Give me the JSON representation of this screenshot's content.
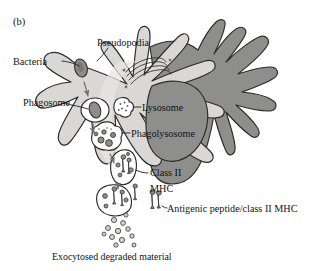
{
  "figure": {
    "panel_letter": "(b)",
    "caption_note": "",
    "domain_subject": "macrophage phagocytosis and class II MHC antigen presentation"
  },
  "labels": {
    "pseudopodia": "Pseudopodia",
    "bacteria": "Bacteria",
    "phagosome": "Phagosome",
    "lysosome": "Lysosome",
    "phagolysosome": "Phagolysosome",
    "class_ii": "Class II",
    "mhc": "MHC",
    "antigenic_peptide": "Antigenic peptide/class II MHC",
    "exocytosed": "Exocytosed degraded material"
  },
  "colors": {
    "cytoplasm": "#d9d8d4",
    "cytoplasm_light": "#e4e3df",
    "nucleus": "#8e8e8c",
    "cell_back": "#8e8e8c",
    "outline": "#2b2b2b",
    "bacteria_fill": "#8d8d8b",
    "vesicle_fill": "#ffffff",
    "granule_fill": "#9a9a98",
    "mhc_fill": "#8d8d8b",
    "text": "#141414",
    "background": "#ffffff"
  },
  "structures": {
    "pseudopodia_count": 7,
    "lysosome_granule_dots": 7,
    "phagolysosome_granules": 5,
    "exocytosed_vesicle_count": 12,
    "mhc_molecules_visible": 7,
    "golgi_stack_layers": 4
  },
  "leader_lines": [
    {
      "name": "bacteria-leader",
      "from_label": "Bacteria",
      "to": "bacterium-in-pseudopod"
    },
    {
      "name": "pseudopodia-leader",
      "from_label": "Pseudopodia",
      "to": "pseudopod-tip"
    },
    {
      "name": "phagosome-leader",
      "from_label": "Phagosome",
      "to": "phagosome-vesicle"
    },
    {
      "name": "lysosome-leader",
      "from_label": "Lysosome",
      "to": "lysosome-vesicle"
    },
    {
      "name": "phagolysosome-leader",
      "from_label": "Phagolysosome",
      "to": "phagolysosome-vesicle"
    },
    {
      "name": "classii-mhc-leader",
      "from_label": "Class II MHC",
      "to": "mhc-vesicle"
    },
    {
      "name": "antigenic-peptide-leader",
      "from_label": "Antigenic peptide/class II MHC",
      "to": "surface-mhc"
    }
  ]
}
